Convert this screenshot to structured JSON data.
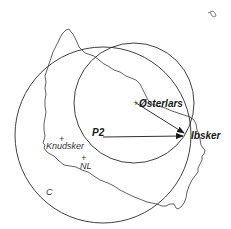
{
  "map": {
    "labels": {
      "osterlars": "Østerlars",
      "ibsker": "Ibsker",
      "p2": "P2",
      "knudsker": "Knudsker",
      "nl": "NL",
      "c": "C"
    },
    "markers": {
      "cross": "+"
    },
    "colors": {
      "line": "#2a2a2a",
      "coast": "#3a3a3a",
      "background": "#ffffff"
    },
    "circles": [
      {
        "name": "C",
        "cx": 103,
        "cy": 135,
        "r": 88
      },
      {
        "name": "inner",
        "cx": 134,
        "cy": 103,
        "r": 60
      }
    ],
    "arrows": [
      {
        "from": "Østerlars",
        "to": "Ibsker"
      },
      {
        "from": "P2",
        "to": "Ibsker"
      }
    ],
    "inset_icon": "christianso-islet-icon"
  }
}
